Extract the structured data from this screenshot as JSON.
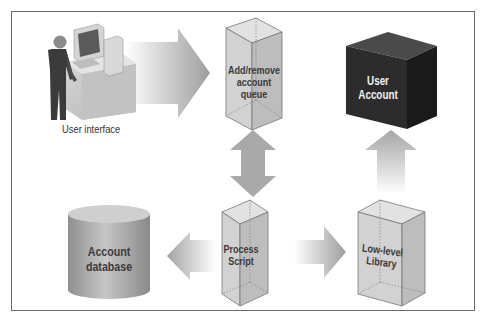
{
  "diagram": {
    "user_interface_label": "User interface",
    "queue_label": "Add/remove account queue",
    "queue_lines": [
      "Add/remove",
      "account",
      "queue"
    ],
    "user_account_lines": [
      "User",
      "Account"
    ],
    "database_lines": [
      "Account",
      "database"
    ],
    "process_script_lines": [
      "Process",
      "Script"
    ],
    "library_lines": [
      "Low-level",
      "Library"
    ]
  },
  "colors": {
    "frame_border": "#6a6a6a",
    "arrow_gray": "#a8a8a8",
    "box_face": "#cfcfcf",
    "user_account_box": "#2e2e2e",
    "database": "#a9a9a9"
  }
}
